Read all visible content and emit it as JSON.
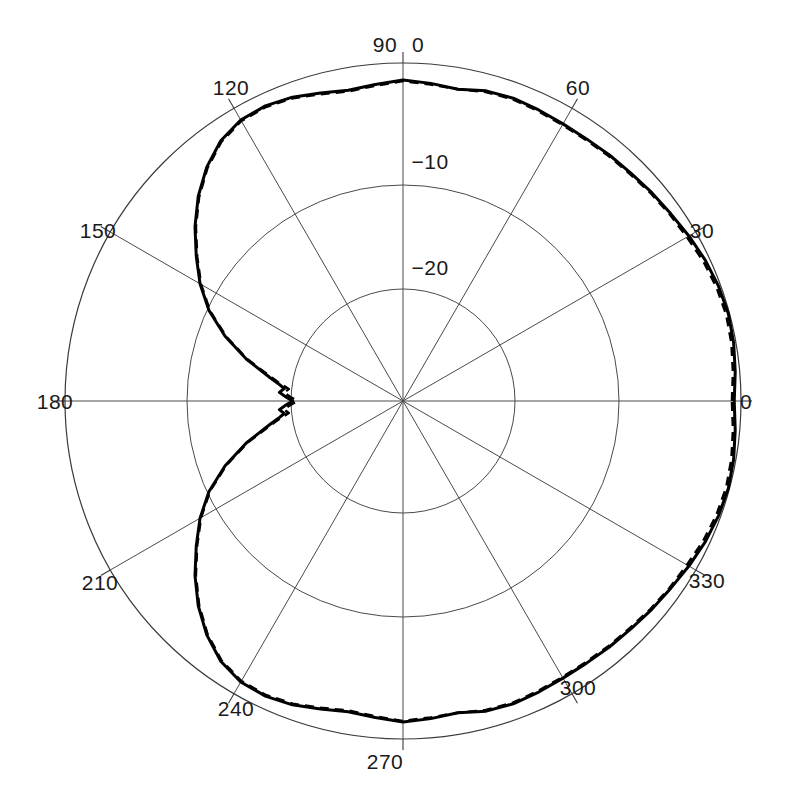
{
  "chart_data": {
    "type": "line",
    "subtype": "polar-radiation-pattern",
    "title": "",
    "xlabel": "",
    "ylabel": "",
    "angle_unit": "degrees",
    "radial_unit": "dB",
    "radial_ticks": [
      0,
      -10,
      -20
    ],
    "radial_tick_labels": [
      "0",
      "−10",
      "−20"
    ],
    "rlim": [
      -30,
      0
    ],
    "angle_ticks": [
      0,
      30,
      60,
      90,
      120,
      150,
      180,
      210,
      240,
      270,
      300,
      330
    ],
    "angle_tick_labels": [
      "0",
      "30",
      "60",
      "90",
      "120",
      "150",
      "180",
      "210",
      "240",
      "270",
      "300",
      "330"
    ],
    "angle_direction": "counterclockwise",
    "angle_zero_location": "E",
    "grid": true,
    "legend": "none",
    "series": [
      {
        "name": "measured",
        "style": "solid",
        "color": "#000000",
        "angles": [
          0,
          5,
          10,
          15,
          20,
          25,
          30,
          35,
          40,
          45,
          50,
          55,
          60,
          65,
          70,
          75,
          80,
          85,
          90,
          95,
          100,
          105,
          110,
          115,
          120,
          125,
          130,
          135,
          140,
          145,
          150,
          155,
          160,
          165,
          170,
          172,
          174,
          176,
          178,
          180,
          182,
          184,
          186,
          188,
          190,
          195,
          200,
          205,
          210,
          215,
          220,
          225,
          230,
          235,
          240,
          245,
          250,
          255,
          260,
          265,
          270,
          275,
          280,
          285,
          290,
          295,
          300,
          305,
          310,
          315,
          320,
          325,
          330,
          335,
          340,
          345,
          350,
          355,
          360
        ],
        "values_db": [
          -0.6,
          -0.4,
          -0.2,
          -0.1,
          -0.2,
          -0.4,
          -0.7,
          -1.0,
          -1.2,
          -1.4,
          -1.5,
          -1.6,
          -1.6,
          -1.5,
          -1.4,
          -1.5,
          -1.9,
          -1.7,
          -1.5,
          -1.8,
          -2.0,
          -1.7,
          -1.3,
          -1.1,
          -1.2,
          -1.8,
          -2.9,
          -4.3,
          -5.9,
          -7.6,
          -9.2,
          -11.0,
          -13.2,
          -15.6,
          -18.0,
          -18.8,
          -19.4,
          -19.0,
          -19.6,
          -20.2,
          -19.6,
          -19.0,
          -19.4,
          -18.8,
          -18.0,
          -15.6,
          -13.2,
          -11.0,
          -9.2,
          -7.6,
          -5.9,
          -4.3,
          -2.9,
          -1.8,
          -1.2,
          -1.1,
          -1.3,
          -1.7,
          -2.0,
          -1.8,
          -1.5,
          -1.7,
          -1.9,
          -1.5,
          -1.4,
          -1.5,
          -1.6,
          -1.6,
          -1.5,
          -1.4,
          -1.2,
          -1.0,
          -0.7,
          -0.4,
          -0.2,
          -0.1,
          -0.2,
          -0.4,
          -0.6
        ]
      },
      {
        "name": "simulated",
        "style": "dashed",
        "color": "#000000",
        "angles": [
          0,
          5,
          10,
          15,
          20,
          25,
          30,
          35,
          40,
          45,
          50,
          55,
          60,
          65,
          70,
          75,
          80,
          85,
          90,
          95,
          100,
          105,
          110,
          115,
          120,
          125,
          130,
          135,
          140,
          145,
          150,
          155,
          160,
          165,
          170,
          172,
          174,
          176,
          178,
          180,
          182,
          184,
          186,
          188,
          190,
          195,
          200,
          205,
          210,
          215,
          220,
          225,
          230,
          235,
          240,
          245,
          250,
          255,
          260,
          265,
          270,
          275,
          280,
          285,
          290,
          295,
          300,
          305,
          310,
          315,
          320,
          325,
          330,
          335,
          340,
          345,
          350,
          355,
          360
        ],
        "values_db": [
          -0.8,
          -0.6,
          -0.4,
          -0.3,
          -0.4,
          -0.6,
          -0.9,
          -1.1,
          -1.3,
          -1.5,
          -1.6,
          -1.7,
          -1.7,
          -1.6,
          -1.5,
          -1.6,
          -1.9,
          -1.8,
          -1.6,
          -1.9,
          -2.1,
          -1.8,
          -1.4,
          -1.2,
          -1.3,
          -1.9,
          -3.0,
          -4.4,
          -6.0,
          -7.7,
          -9.3,
          -11.1,
          -13.3,
          -15.7,
          -18.2,
          -19.0,
          -19.8,
          -19.4,
          -20.0,
          -20.6,
          -20.0,
          -19.4,
          -19.8,
          -19.0,
          -18.2,
          -15.7,
          -13.3,
          -11.1,
          -9.3,
          -7.7,
          -6.0,
          -4.4,
          -3.0,
          -1.9,
          -1.3,
          -1.2,
          -1.4,
          -1.8,
          -2.1,
          -1.9,
          -1.6,
          -1.8,
          -1.9,
          -1.6,
          -1.5,
          -1.6,
          -1.7,
          -1.7,
          -1.6,
          -1.5,
          -1.3,
          -1.1,
          -0.9,
          -0.6,
          -0.4,
          -0.3,
          -0.4,
          -0.6,
          -0.8
        ]
      }
    ]
  },
  "geometry": {
    "center_x": 403,
    "center_y": 401,
    "outer_radius": 338,
    "ring_radii": [
      338,
      216,
      112
    ]
  },
  "labels": {
    "angles": [
      {
        "text": "0",
        "deg": 0,
        "x": 746,
        "y": 409
      },
      {
        "text": "30",
        "deg": 30,
        "x": 702,
        "y": 238
      },
      {
        "text": "60",
        "deg": 60,
        "x": 578,
        "y": 95
      },
      {
        "text": "90",
        "deg": 90,
        "x": 385,
        "y": 52
      },
      {
        "text": "120",
        "deg": 120,
        "x": 231,
        "y": 95
      },
      {
        "text": "150",
        "deg": 150,
        "x": 98,
        "y": 238
      },
      {
        "text": "180",
        "deg": 180,
        "x": 55,
        "y": 409
      },
      {
        "text": "210",
        "deg": 210,
        "x": 100,
        "y": 590
      },
      {
        "text": "240",
        "deg": 240,
        "x": 236,
        "y": 716
      },
      {
        "text": "270",
        "deg": 270,
        "x": 385,
        "y": 769
      },
      {
        "text": "300",
        "deg": 300,
        "x": 578,
        "y": 695
      },
      {
        "text": "330",
        "deg": 330,
        "x": 707,
        "y": 588
      }
    ],
    "radial": [
      {
        "text": "0",
        "db": 0,
        "x": 418,
        "y": 52
      },
      {
        "text": "−10",
        "db": -10,
        "x": 430,
        "y": 169
      },
      {
        "text": "−20",
        "db": -20,
        "x": 430,
        "y": 275
      }
    ]
  }
}
